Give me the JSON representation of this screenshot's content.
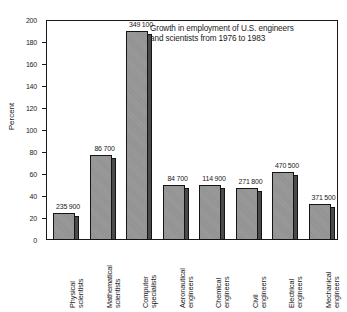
{
  "chart_data": {
    "type": "bar",
    "title": "Growth in employment of U.S. engineers and scientists from 1976 to 1983",
    "title_line1": "Growth in employment of U.S. engineers",
    "title_line2": "and scientists from 1976 to 1983",
    "xlabel": "",
    "ylabel": "Percent",
    "ylim": [
      0,
      200
    ],
    "yticks": [
      0,
      20,
      40,
      60,
      80,
      100,
      120,
      140,
      160,
      180,
      200
    ],
    "grid": false,
    "legend": "none",
    "categories": [
      "Physical scientists",
      "Mathematical scientists",
      "Computer specialists",
      "Aeronautical engineers",
      "Chemical engineers",
      "Civil engineers",
      "Electrical engineers",
      "Mechanical engineers"
    ],
    "category_lines": [
      [
        "Physical",
        "scientists"
      ],
      [
        "Mathematical",
        "scientists"
      ],
      [
        "Computer",
        "specialists"
      ],
      [
        "Aeronautical",
        "engineers"
      ],
      [
        "Chemical",
        "engineers"
      ],
      [
        "Civil",
        "engineers"
      ],
      [
        "Electrical",
        "engineers"
      ],
      [
        "Mechanical",
        "engineers"
      ]
    ],
    "values": [
      25,
      77,
      190,
      50,
      50,
      47,
      62,
      33
    ],
    "data_labels": [
      "235 900",
      "86 700",
      "349 100",
      "84 700",
      "114 900",
      "271 800",
      "470 500",
      "371 500"
    ],
    "colors": {
      "bar_face": "#9a9a9a",
      "bar_side": "#4a4a4a",
      "outline": "#141414",
      "background": "#ffffff",
      "text": "#1a1a1a"
    }
  }
}
